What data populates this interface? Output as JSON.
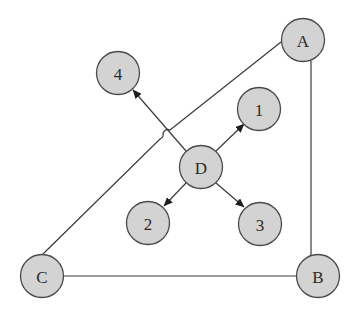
{
  "diagram": {
    "type": "graph",
    "nodes": [
      {
        "id": "A",
        "label": "A"
      },
      {
        "id": "B",
        "label": "B"
      },
      {
        "id": "C",
        "label": "C"
      },
      {
        "id": "D",
        "label": "D"
      },
      {
        "id": "1",
        "label": "1"
      },
      {
        "id": "2",
        "label": "2"
      },
      {
        "id": "3",
        "label": "3"
      },
      {
        "id": "4",
        "label": "4"
      }
    ],
    "undirected_edges": [
      {
        "from": "A",
        "to": "C"
      },
      {
        "from": "A",
        "to": "B"
      },
      {
        "from": "C",
        "to": "B"
      }
    ],
    "directed_edges": [
      {
        "from": "D",
        "to": "1"
      },
      {
        "from": "D",
        "to": "2"
      },
      {
        "from": "D",
        "to": "3"
      },
      {
        "from": "D",
        "to": "4"
      }
    ],
    "colors": {
      "node_fill": "#d3d3d3",
      "node_stroke": "#4a4a4a",
      "edge": "#3a3a3a",
      "text": "#2a2a2a"
    }
  }
}
